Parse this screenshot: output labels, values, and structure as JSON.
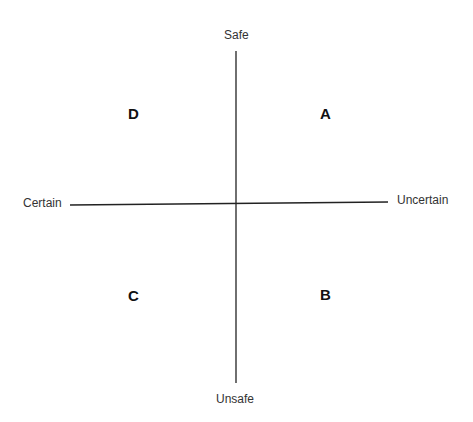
{
  "diagram": {
    "type": "quadrant",
    "axes": {
      "vertical": {
        "top_label": "Safe",
        "bottom_label": "Unsafe"
      },
      "horizontal": {
        "left_label": "Certain",
        "right_label": "Uncertain"
      }
    },
    "quadrants": {
      "top_right": "A",
      "bottom_right": "B",
      "bottom_left": "C",
      "top_left": "D"
    },
    "colors": {
      "line": "#222222",
      "text": "#111111"
    }
  }
}
